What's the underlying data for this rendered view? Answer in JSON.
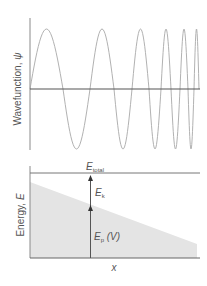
{
  "figure": {
    "top_panel": {
      "ylabel": "Wavefunction, ",
      "ylabel_symbol": "ψ",
      "curve": "oscillating wavefunction with increasing frequency and constant amplitude",
      "zero_crossings_px": [
        30,
        63,
        90,
        114,
        132,
        149,
        161,
        171,
        180,
        188,
        194,
        199
      ],
      "amplitude_px": 60
    },
    "bottom_panel": {
      "ylabel": "Energy, ",
      "ylabel_symbol": "E",
      "xlabel": "x",
      "total_energy": {
        "symbol": "E",
        "subscript": "total"
      },
      "kinetic_energy": {
        "symbol": "E",
        "subscript": "k"
      },
      "potential_energy": {
        "symbol": "E",
        "subscript": "p",
        "suffix": " (V)"
      },
      "potential_shape": "linearly decreasing potential (shaded region)"
    },
    "colors": {
      "axis": "#666666",
      "curve": "#9a9a9a",
      "shade": "#e6e6e6",
      "text": "#555555",
      "arrow": "#444444"
    }
  }
}
